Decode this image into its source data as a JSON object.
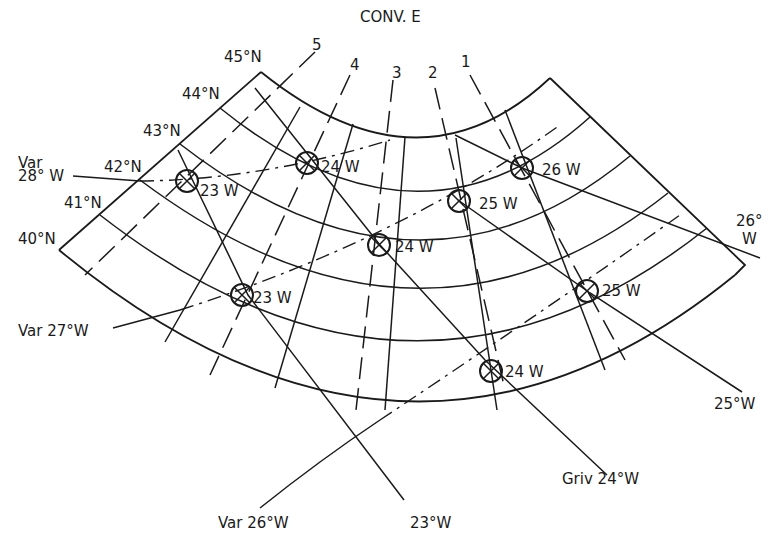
{
  "title": "CONV. E",
  "latitudes": [
    "45°N",
    "44°N",
    "43°N",
    "42°N",
    "41°N",
    "40°N"
  ],
  "track_lines": [
    "5",
    "4",
    "3",
    "2",
    "1"
  ],
  "variation_labels": {
    "var28": {
      "line1": "Var",
      "line2": "28° W"
    },
    "var27": "Var 27°W",
    "var26": "Var 26°W"
  },
  "grivation_labels": {
    "g23": "23°W",
    "g24": "Griv 24°W",
    "g25": "25°W",
    "g26": {
      "line1": "26°",
      "line2": "W"
    }
  },
  "fixes": [
    {
      "id": "f1",
      "label": "23 W"
    },
    {
      "id": "f2",
      "label": "24 W"
    },
    {
      "id": "f3",
      "label": "26 W"
    },
    {
      "id": "f4",
      "label": "25 W"
    },
    {
      "id": "f5",
      "label": "24 W"
    },
    {
      "id": "f6",
      "label": "23 W"
    },
    {
      "id": "f7",
      "label": "25 W"
    },
    {
      "id": "f8",
      "label": "24 W"
    }
  ]
}
